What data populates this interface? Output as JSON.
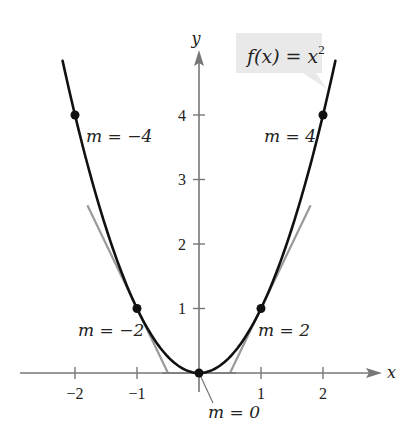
{
  "title_label": {
    "prefix": "f(x) = x",
    "exponent": "2"
  },
  "axes": {
    "x_label": "x",
    "y_label": "y",
    "x_ticks": [
      {
        "value": -2,
        "label": "−2"
      },
      {
        "value": -1,
        "label": "−1"
      },
      {
        "value": 1,
        "label": "1"
      },
      {
        "value": 2,
        "label": "2"
      }
    ],
    "y_ticks": [
      {
        "value": 1,
        "label": "1"
      },
      {
        "value": 2,
        "label": "2"
      },
      {
        "value": 3,
        "label": "3"
      },
      {
        "value": 4,
        "label": "4"
      }
    ]
  },
  "points": [
    {
      "x": -2,
      "y": 4,
      "slope": -4,
      "label": "m = −4"
    },
    {
      "x": -1,
      "y": 1,
      "slope": -2,
      "label": "m = −2"
    },
    {
      "x": 0,
      "y": 0,
      "slope": 0,
      "label": "m = 0"
    },
    {
      "x": 1,
      "y": 1,
      "slope": 2,
      "label": "m = 2"
    },
    {
      "x": 2,
      "y": 4,
      "slope": 4,
      "label": "m = 4"
    }
  ],
  "colors": {
    "curve": "#111111",
    "axis": "#777777",
    "tangent": "#9a9a9a",
    "callout_bg": "#e9e9e9",
    "text": "#222222"
  },
  "chart_data": {
    "type": "line",
    "xlabel": "x",
    "ylabel": "y",
    "xlim": [
      -2.5,
      3
    ],
    "ylim": [
      -0.4,
      5
    ],
    "series": [
      {
        "name": "f(x) = x^2",
        "function": "x^2",
        "domain": [
          -2.2,
          2.2
        ]
      }
    ],
    "highlighted_points": [
      {
        "x": -2,
        "y": 4,
        "slope": -4
      },
      {
        "x": -1,
        "y": 1,
        "slope": -2
      },
      {
        "x": 0,
        "y": 0,
        "slope": 0
      },
      {
        "x": 1,
        "y": 1,
        "slope": 2
      },
      {
        "x": 2,
        "y": 4,
        "slope": 4
      }
    ],
    "tangent_lines_drawn_at": [
      -1,
      0,
      1
    ]
  }
}
